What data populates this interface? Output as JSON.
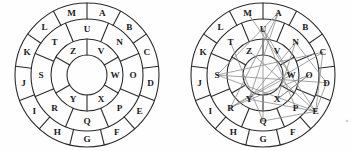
{
  "figure": {
    "title": "",
    "colors": {
      "ink": "#2b2b2b",
      "glyph": "#1a1a1a",
      "overlay": "#8c8c8c",
      "background": "#ffffff"
    }
  },
  "wheels": [
    {
      "id": "wheel-left",
      "name": "plain-cipher-wheel",
      "has_overlay": false,
      "rings": [
        {
          "name": "outer-ring",
          "sector_count": 13,
          "start_angle_deg": -90,
          "labels": [
            "A",
            "B",
            "C",
            "D",
            "E",
            "F",
            "G",
            "H",
            "I",
            "J",
            "K",
            "L",
            "M"
          ]
        },
        {
          "name": "middle-ring",
          "sector_count": 8,
          "start_angle_deg": -67.5,
          "labels": [
            "N",
            "O",
            "P",
            "Q",
            "R",
            "S",
            "T",
            "U"
          ]
        },
        {
          "name": "inner-ring",
          "sector_count": 6,
          "start_angle_deg": -90,
          "labels": [
            "V",
            "W",
            "X",
            "Y",
            "",
            "Z"
          ]
        }
      ]
    },
    {
      "id": "wheel-right",
      "name": "overlaid-cipher-wheel",
      "has_overlay": true,
      "rings": [
        {
          "name": "outer-ring",
          "sector_count": 13,
          "start_angle_deg": -90,
          "labels": [
            "A",
            "B",
            "C",
            "D",
            "E",
            "F",
            "G",
            "H",
            "I",
            "J",
            "K",
            "L",
            "M"
          ]
        },
        {
          "name": "middle-ring",
          "sector_count": 8,
          "start_angle_deg": -67.5,
          "labels": [
            "N",
            "O",
            "P",
            "Q",
            "R",
            "S",
            "T",
            "U"
          ]
        },
        {
          "name": "inner-ring",
          "sector_count": 6,
          "start_angle_deg": -90,
          "labels": [
            "V",
            "W",
            "X",
            "Y",
            "",
            "Z"
          ]
        }
      ],
      "overlay_path_letters": [
        "A",
        "S",
        "C",
        "E",
        "D",
        "N",
        "X",
        "O",
        "R",
        "W",
        "U",
        "Q",
        "E",
        "Y",
        "A"
      ]
    }
  ],
  "geometry": {
    "cx": 87,
    "cy": 75,
    "r_outer": 72,
    "r_mid": 56,
    "r_inner": 36,
    "r_core": 20,
    "label_r_outer": 64,
    "label_r_mid": 46,
    "label_r_inner": 28,
    "label_r_core": 11
  }
}
